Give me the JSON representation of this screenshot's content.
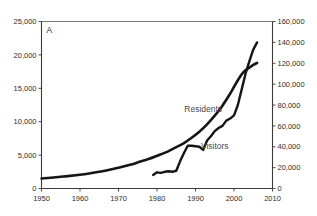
{
  "figure": {
    "panel_label": "A",
    "background": "#ffffff",
    "line_color": "#151515"
  },
  "chart_data": {
    "type": "line",
    "title": "",
    "subtitle": "",
    "xlabel": "",
    "ylabel": "",
    "grid": false,
    "legend_position": "inline-annotation",
    "xlim": [
      1950,
      2010
    ],
    "xticks": [
      1950,
      1960,
      1970,
      1980,
      1990,
      2000,
      2010
    ],
    "xticklabels": [
      "1950",
      "1960",
      "1970",
      "1980",
      "1990",
      "2000",
      "2010"
    ],
    "axes": [
      {
        "id": "left",
        "name": "Residents",
        "lim": [
          0,
          25000
        ],
        "ticks": [
          0,
          5000,
          10000,
          15000,
          20000,
          25000
        ],
        "ticklabels": [
          "0",
          "5,000",
          "10,000",
          "15,000",
          "20,000",
          "25,000"
        ]
      },
      {
        "id": "right",
        "name": "Visitors",
        "lim": [
          0,
          160000
        ],
        "ticks": [
          0,
          20000,
          40000,
          60000,
          80000,
          100000,
          120000,
          140000,
          160000
        ],
        "ticklabels": [
          "0",
          "20,000",
          "40,000",
          "60,000",
          "80,000",
          "100,000",
          "120,000",
          "140,000",
          "160,000"
        ]
      }
    ],
    "series": [
      {
        "name": "Residents",
        "axis": "left",
        "label": "Residents",
        "label_x": 1992,
        "label_y": 11500,
        "x": [
          1950,
          1955,
          1960,
          1962,
          1965,
          1968,
          1970,
          1973,
          1975,
          1978,
          1980,
          1983,
          1985,
          1987,
          1989,
          1991,
          1993,
          1995,
          1997,
          1999,
          2000,
          2001,
          2002,
          2003,
          2004,
          2005,
          2006
        ],
        "values": [
          1500,
          1750,
          2050,
          2200,
          2500,
          2850,
          3100,
          3550,
          3900,
          4450,
          4900,
          5600,
          6200,
          6800,
          7600,
          8500,
          9600,
          10900,
          12400,
          14200,
          15200,
          16200,
          17100,
          17700,
          18100,
          18500,
          18800
        ]
      },
      {
        "name": "Visitors",
        "axis": "right",
        "label": "Visitors",
        "label_x": 1995,
        "label_y": 38000,
        "x": [
          1979,
          1980,
          1981,
          1982,
          1983,
          1984,
          1985,
          1986,
          1987,
          1988,
          1989,
          1990,
          1991,
          1992,
          1993,
          1994,
          1995,
          1996,
          1997,
          1998,
          1999,
          2000,
          2001,
          2002,
          2003,
          2004,
          2005,
          2006
        ],
        "values": [
          13000,
          15500,
          15000,
          16000,
          16500,
          16000,
          17000,
          26000,
          34000,
          41000,
          41000,
          40500,
          40000,
          37000,
          46000,
          50000,
          55000,
          58000,
          60000,
          65000,
          67000,
          70000,
          80000,
          95000,
          110000,
          122000,
          133000,
          140000
        ]
      }
    ]
  }
}
